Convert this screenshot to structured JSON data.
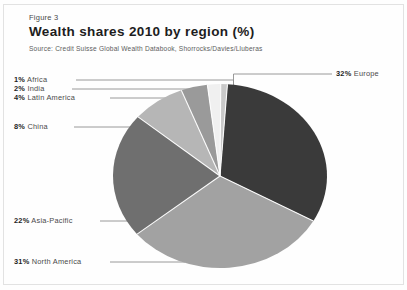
{
  "figure": {
    "number": "Figure 3",
    "title": "Wealth shares 2010 by region (%)",
    "source": "Source: Credit Suisse Global Wealth Databook, Shorrocks/Davies/Lluberas"
  },
  "chart_data": {
    "type": "pie",
    "title": "Wealth shares 2010 by region (%)",
    "subtitle": "Source: Credit Suisse Global Wealth Databook, Shorrocks/Davies/Lluberas",
    "unit": "%",
    "legend_position": "callout-labels",
    "grid": false,
    "categories": [
      "Europe",
      "North America",
      "Asia-Pacific",
      "China",
      "Latin America",
      "India",
      "Africa"
    ],
    "values": [
      32,
      31,
      22,
      8,
      4,
      2,
      1
    ],
    "labels": [
      {
        "pct": "32%",
        "name": "Europe",
        "value": 32,
        "color": "#3a3a3a"
      },
      {
        "pct": "31%",
        "name": "North America",
        "value": 31,
        "color": "#a2a2a2"
      },
      {
        "pct": "22%",
        "name": "Asia-Pacific",
        "value": 22,
        "color": "#6f6f6f"
      },
      {
        "pct": "8%",
        "name": "China",
        "value": 8,
        "color": "#b6b6b6"
      },
      {
        "pct": "4%",
        "name": "Latin America",
        "value": 4,
        "color": "#9a9a9a"
      },
      {
        "pct": "2%",
        "name": "India",
        "value": 2,
        "color": "#f0f0f0"
      },
      {
        "pct": "1%",
        "name": "Africa",
        "value": 1,
        "color": "#c9c9c9"
      }
    ]
  }
}
